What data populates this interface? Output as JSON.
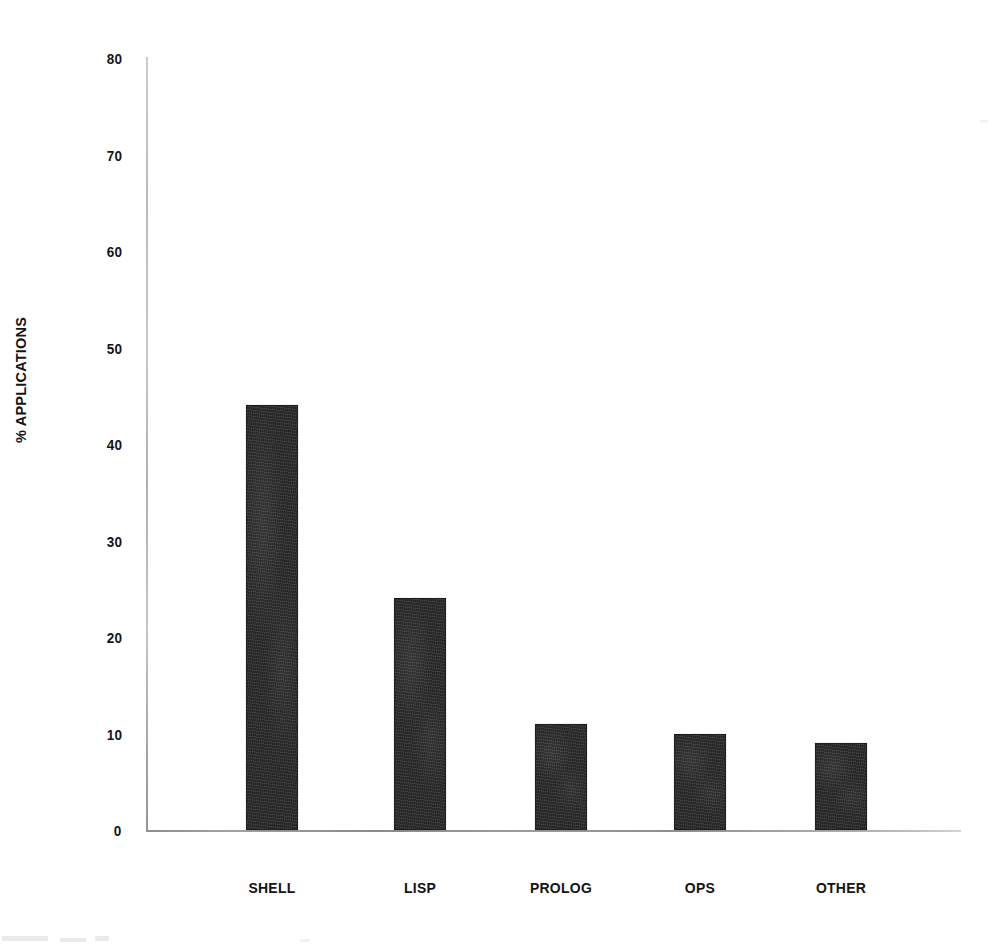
{
  "chart_data": {
    "type": "bar",
    "title": "",
    "subtitle": "",
    "xlabel": "",
    "ylabel": "% APPLICATIONS",
    "categories": [
      "SHELL",
      "LISP",
      "PROLOG",
      "OPS",
      "OTHER"
    ],
    "values": [
      44,
      24,
      11,
      10,
      9
    ],
    "ylim": [
      0,
      80
    ],
    "ytick_labels": [
      "0",
      "10",
      "20",
      "30",
      "40",
      "50",
      "60",
      "70",
      "80"
    ],
    "ytick_values": [
      0,
      10,
      20,
      30,
      40,
      50,
      60,
      70,
      80
    ],
    "grid": false,
    "legend": null,
    "legend_position": "none",
    "annotations": [],
    "series": [
      {
        "name": "% APPLICATIONS",
        "values": [
          44,
          24,
          11,
          10,
          9
        ]
      }
    ],
    "bar_color": "#2c2c2c",
    "background_color": "#ffffff",
    "axis_color": "#8f8f8f"
  },
  "axis": {
    "y_title": "% APPLICATIONS",
    "ticks": [
      {
        "label": "80",
        "value": 80
      },
      {
        "label": "70",
        "value": 70
      },
      {
        "label": "60",
        "value": 60
      },
      {
        "label": "50",
        "value": 50
      },
      {
        "label": "40",
        "value": 40
      },
      {
        "label": "30",
        "value": 30
      },
      {
        "label": "20",
        "value": 20
      },
      {
        "label": "10",
        "value": 10
      },
      {
        "label": "0",
        "value": 0
      }
    ]
  },
  "bars": [
    {
      "label": "SHELL",
      "value": 44
    },
    {
      "label": "LISP",
      "value": 24
    },
    {
      "label": "PROLOG",
      "value": 11
    },
    {
      "label": "OPS",
      "value": 10
    },
    {
      "label": "OTHER",
      "value": 9
    }
  ]
}
